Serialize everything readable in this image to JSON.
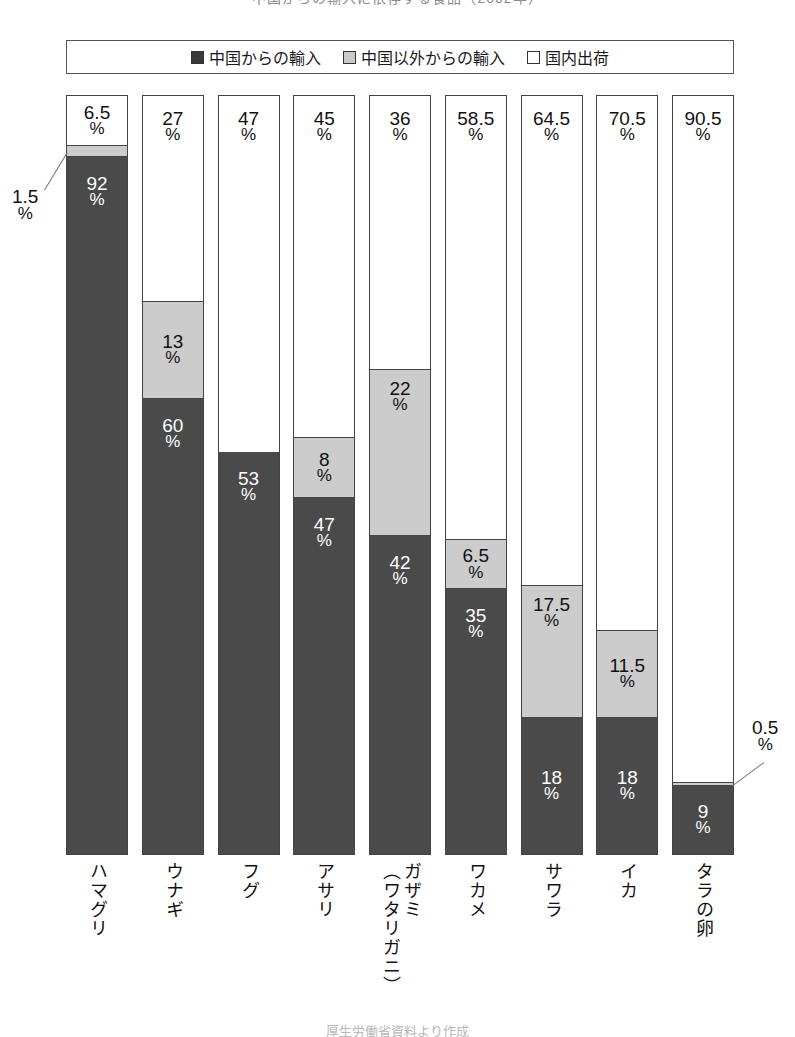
{
  "title": "中国からの輸入に依存する食品（2002年）",
  "footer_note": "厚生労働省資料より作成",
  "legend": {
    "items": [
      {
        "key": "china",
        "label": "中国からの輸入",
        "color": "#3a3a3a"
      },
      {
        "key": "other",
        "label": "中国以外からの輸入",
        "color": "#c9c9c9"
      },
      {
        "key": "domestic",
        "label": "国内出荷",
        "color": "#ffffff"
      }
    ]
  },
  "chart_data": {
    "type": "bar",
    "subtype": "stacked-100-percent",
    "orientation": "vertical",
    "title": "中国からの輸入に依存する食品（2002年）",
    "xlabel": "",
    "ylabel": "",
    "ylim": [
      0,
      100
    ],
    "unit": "%",
    "grid": false,
    "legend_position": "top",
    "categories": [
      "ハマグリ",
      "ウナギ",
      "フグ",
      "アサリ",
      "ガザミ（ワタリガニ）",
      "ワカメ",
      "サワラ",
      "イカ",
      "タラの卵"
    ],
    "category_lines": [
      [
        "ハマグリ"
      ],
      [
        "ウナギ"
      ],
      [
        "フグ"
      ],
      [
        "アサリ"
      ],
      [
        "ガザミ",
        "（ワタリガニ）"
      ],
      [
        "ワカメ"
      ],
      [
        "サワラ"
      ],
      [
        "イカ"
      ],
      [
        "タラの卵"
      ]
    ],
    "series": [
      {
        "name": "中国からの輸入",
        "key": "china",
        "color": "#4a4a4a",
        "values": [
          92,
          60,
          53,
          47,
          42,
          35,
          18,
          18,
          9
        ]
      },
      {
        "name": "中国以外からの輸入",
        "key": "other",
        "color": "#cccccc",
        "values": [
          1.5,
          13,
          0,
          8,
          22,
          6.5,
          17.5,
          11.5,
          0.5
        ]
      },
      {
        "name": "国内出荷",
        "key": "domestic",
        "color": "#ffffff",
        "values": [
          6.5,
          27,
          47,
          45,
          36,
          58.5,
          64.5,
          70.5,
          90.5
        ]
      }
    ]
  },
  "bars": [
    {
      "category": "ハマグリ",
      "lines": [
        "ハマグリ"
      ],
      "segments": [
        {
          "key": "domestic",
          "value": 6.5,
          "label": "6.5",
          "pct": "%",
          "label_mode": "inside"
        },
        {
          "key": "other",
          "value": 1.5,
          "label": "1.5",
          "pct": "%",
          "label_mode": "callout-left"
        },
        {
          "key": "china",
          "value": 92,
          "label": "92",
          "pct": "%",
          "label_mode": "inside"
        }
      ]
    },
    {
      "category": "ウナギ",
      "lines": [
        "ウナギ"
      ],
      "segments": [
        {
          "key": "domestic",
          "value": 27,
          "label": "27",
          "pct": "%",
          "label_mode": "inside"
        },
        {
          "key": "other",
          "value": 13,
          "label": "13",
          "pct": "%",
          "label_mode": "inside"
        },
        {
          "key": "china",
          "value": 60,
          "label": "60",
          "pct": "%",
          "label_mode": "inside"
        }
      ]
    },
    {
      "category": "フグ",
      "lines": [
        "フグ"
      ],
      "segments": [
        {
          "key": "domestic",
          "value": 47,
          "label": "47",
          "pct": "%",
          "label_mode": "inside"
        },
        {
          "key": "other",
          "value": 0,
          "label": "",
          "pct": "",
          "label_mode": "none"
        },
        {
          "key": "china",
          "value": 53,
          "label": "53",
          "pct": "%",
          "label_mode": "inside"
        }
      ]
    },
    {
      "category": "アサリ",
      "lines": [
        "アサリ"
      ],
      "segments": [
        {
          "key": "domestic",
          "value": 45,
          "label": "45",
          "pct": "%",
          "label_mode": "inside"
        },
        {
          "key": "other",
          "value": 8,
          "label": "8",
          "pct": "%",
          "label_mode": "inside"
        },
        {
          "key": "china",
          "value": 47,
          "label": "47",
          "pct": "%",
          "label_mode": "inside"
        }
      ]
    },
    {
      "category": "ガザミ（ワタリガニ）",
      "lines": [
        "ガザミ",
        "（ワタリガニ）"
      ],
      "segments": [
        {
          "key": "domestic",
          "value": 36,
          "label": "36",
          "pct": "%",
          "label_mode": "inside"
        },
        {
          "key": "other",
          "value": 22,
          "label": "22",
          "pct": "%",
          "label_mode": "inside"
        },
        {
          "key": "china",
          "value": 42,
          "label": "42",
          "pct": "%",
          "label_mode": "inside"
        }
      ]
    },
    {
      "category": "ワカメ",
      "lines": [
        "ワカメ"
      ],
      "segments": [
        {
          "key": "domestic",
          "value": 58.5,
          "label": "58.5",
          "pct": "%",
          "label_mode": "inside"
        },
        {
          "key": "other",
          "value": 6.5,
          "label": "6.5",
          "pct": "%",
          "label_mode": "inside"
        },
        {
          "key": "china",
          "value": 35,
          "label": "35",
          "pct": "%",
          "label_mode": "inside"
        }
      ]
    },
    {
      "category": "サワラ",
      "lines": [
        "サワラ"
      ],
      "segments": [
        {
          "key": "domestic",
          "value": 64.5,
          "label": "64.5",
          "pct": "%",
          "label_mode": "inside"
        },
        {
          "key": "other",
          "value": 17.5,
          "label": "17.5",
          "pct": "%",
          "label_mode": "inside"
        },
        {
          "key": "china",
          "value": 18,
          "label": "18",
          "pct": "%",
          "label_mode": "inside"
        }
      ]
    },
    {
      "category": "イカ",
      "lines": [
        "イカ"
      ],
      "segments": [
        {
          "key": "domestic",
          "value": 70.5,
          "label": "70.5",
          "pct": "%",
          "label_mode": "inside"
        },
        {
          "key": "other",
          "value": 11.5,
          "label": "11.5",
          "pct": "%",
          "label_mode": "inside"
        },
        {
          "key": "china",
          "value": 18,
          "label": "18",
          "pct": "%",
          "label_mode": "inside"
        }
      ]
    },
    {
      "category": "タラの卵",
      "lines": [
        "タラの卵"
      ],
      "segments": [
        {
          "key": "domestic",
          "value": 90.5,
          "label": "90.5",
          "pct": "%",
          "label_mode": "inside"
        },
        {
          "key": "other",
          "value": 0.5,
          "label": "0.5",
          "pct": "%",
          "label_mode": "callout-right"
        },
        {
          "key": "china",
          "value": 9,
          "label": "9",
          "pct": "%",
          "label_mode": "inside"
        }
      ]
    }
  ]
}
